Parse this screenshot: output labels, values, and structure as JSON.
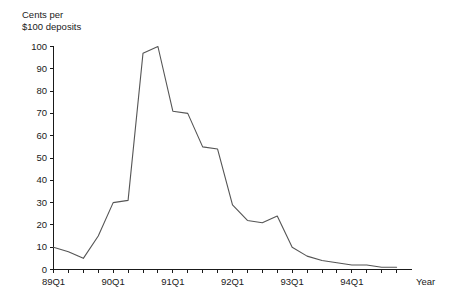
{
  "chart_data": {
    "type": "line",
    "title": "",
    "ylabel": "Cents per\n$100 deposits",
    "xlabel": "Year",
    "ylim": [
      0,
      100
    ],
    "ytick_values": [
      0,
      10,
      20,
      30,
      40,
      50,
      60,
      70,
      80,
      90,
      100
    ],
    "ytick_labels": [
      "0",
      "10",
      "20",
      "30",
      "40",
      "50",
      "60",
      "70",
      "80",
      "90",
      "100"
    ],
    "grid": false,
    "legend": false,
    "x": [
      "89Q1",
      "89Q2",
      "89Q3",
      "89Q4",
      "90Q1",
      "90Q2",
      "90Q3",
      "90Q4",
      "91Q1",
      "91Q2",
      "91Q3",
      "91Q4",
      "92Q1",
      "92Q2",
      "92Q3",
      "92Q4",
      "93Q1",
      "93Q2",
      "93Q3",
      "93Q4",
      "94Q1",
      "94Q2",
      "94Q3",
      "94Q4"
    ],
    "xtick_labels": [
      "89Q1",
      "",
      "",
      "",
      "90Q1",
      "",
      "",
      "",
      "91Q1",
      "",
      "",
      "",
      "92Q1",
      "",
      "",
      "",
      "93Q1",
      "",
      "",
      "",
      "94Q1",
      "",
      "",
      ""
    ],
    "values": [
      10,
      8,
      5,
      15,
      30,
      31,
      97,
      100,
      71,
      70,
      55,
      54,
      29,
      22,
      21,
      24,
      10,
      6,
      4,
      3,
      2,
      2,
      1,
      1
    ],
    "series": [
      {
        "name": "Cents per $100 deposits",
        "values": [
          10,
          8,
          5,
          15,
          30,
          31,
          97,
          100,
          71,
          70,
          55,
          54,
          29,
          22,
          21,
          24,
          10,
          6,
          4,
          3,
          2,
          2,
          1,
          1
        ]
      }
    ]
  }
}
